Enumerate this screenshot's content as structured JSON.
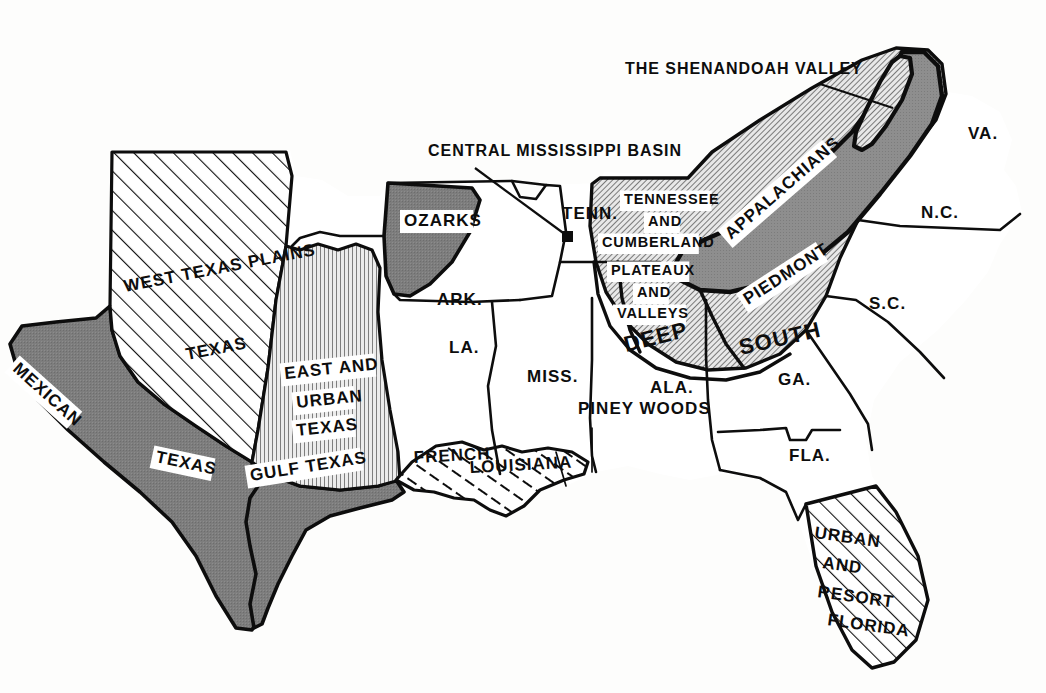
{
  "map": {
    "title": "Regions of the American South",
    "colors": {
      "ink": "#0d0d0d",
      "paper": "#fdfdfc",
      "dark_gray": "#7d7d7d",
      "mid_gray": "#9a9a9a",
      "light_gray": "#c9c9c9",
      "halo_white": "#ffffff"
    },
    "callouts": [
      {
        "id": "shenandoah",
        "text": "THE SHENANDOAH VALLEY",
        "x": 625,
        "y": 74,
        "leader_from": [
          820,
          84
        ],
        "leader_to": [
          893,
          108
        ]
      },
      {
        "id": "central-mississippi-basin",
        "text": "CENTRAL MISSISSIPPI BASIN",
        "x": 428,
        "y": 156,
        "leader_from": [
          475,
          168
        ],
        "leader_to": [
          568,
          237
        ]
      }
    ],
    "state_labels": [
      {
        "id": "tenn",
        "text": "TENN.",
        "x": 562,
        "y": 219
      },
      {
        "id": "ark",
        "text": "ARK.",
        "x": 437,
        "y": 305
      },
      {
        "id": "la",
        "text": "LA.",
        "x": 449,
        "y": 353
      },
      {
        "id": "miss",
        "text": "MISS.",
        "x": 527,
        "y": 382
      },
      {
        "id": "ala",
        "text": "ALA.",
        "x": 650,
        "y": 393
      },
      {
        "id": "ga",
        "text": "GA.",
        "x": 778,
        "y": 385
      },
      {
        "id": "fla",
        "text": "FLA.",
        "x": 789,
        "y": 461
      },
      {
        "id": "sc",
        "text": "S.C.",
        "x": 869,
        "y": 309
      },
      {
        "id": "nc",
        "text": "N.C.",
        "x": 921,
        "y": 218
      },
      {
        "id": "va",
        "text": "VA.",
        "x": 968,
        "y": 139
      }
    ],
    "region_labels": [
      {
        "id": "west-texas-plains",
        "text": "WEST TEXAS PLAINS",
        "x": 125,
        "y": 292,
        "rotate": -11,
        "halo": false,
        "size": "lbl-region"
      },
      {
        "id": "texas",
        "text": "TEXAS",
        "x": 187,
        "y": 360,
        "rotate": -11,
        "halo": false,
        "size": "lbl-region"
      },
      {
        "id": "mexican",
        "text": "MEXICAN",
        "x": 12,
        "y": 370,
        "rotate": 42,
        "halo": true,
        "size": "lbl-region"
      },
      {
        "id": "mexican-texas",
        "text": "TEXAS",
        "x": 155,
        "y": 462,
        "rotate": 12,
        "halo": true,
        "size": "lbl-region"
      },
      {
        "id": "gulf-texas",
        "text": "GULF TEXAS",
        "x": 251,
        "y": 481,
        "rotate": -9,
        "halo": true,
        "size": "lbl-region"
      },
      {
        "id": "east-and",
        "text": "EAST AND",
        "x": 285,
        "y": 379,
        "rotate": -6,
        "halo": true,
        "size": "lbl-region"
      },
      {
        "id": "urban",
        "text": "URBAN",
        "x": 297,
        "y": 408,
        "rotate": -6,
        "halo": true,
        "size": "lbl-region"
      },
      {
        "id": "east-urban-texas",
        "text": "TEXAS",
        "x": 297,
        "y": 436,
        "rotate": -6,
        "halo": true,
        "size": "lbl-region"
      },
      {
        "id": "ozarks",
        "text": "OZARKS",
        "x": 404,
        "y": 226,
        "rotate": 0,
        "halo": true,
        "size": "lbl-region"
      },
      {
        "id": "french",
        "text": "FRENCH",
        "x": 414,
        "y": 463,
        "rotate": -3,
        "halo": false,
        "size": "lbl-region"
      },
      {
        "id": "louisiana",
        "text": "LOUISIANA",
        "x": 470,
        "y": 473,
        "rotate": -3,
        "halo": false,
        "size": "lbl-region"
      },
      {
        "id": "piney-woods",
        "text": "PINEY WOODS",
        "x": 578,
        "y": 414,
        "rotate": 0,
        "halo": false,
        "size": "lbl-region"
      },
      {
        "id": "tennessee",
        "text": "TENNESSEE",
        "x": 624,
        "y": 204,
        "rotate": 0,
        "halo": true,
        "size": "lbl-small"
      },
      {
        "id": "and-1",
        "text": "AND",
        "x": 648,
        "y": 226,
        "rotate": 0,
        "halo": true,
        "size": "lbl-small"
      },
      {
        "id": "cumberland",
        "text": "CUMBERLAND",
        "x": 602,
        "y": 247,
        "rotate": 0,
        "halo": true,
        "size": "lbl-small"
      },
      {
        "id": "plateaux",
        "text": "PLATEAUX",
        "x": 611,
        "y": 275,
        "rotate": 0,
        "halo": true,
        "size": "lbl-small"
      },
      {
        "id": "and-2",
        "text": "AND",
        "x": 637,
        "y": 297,
        "rotate": 0,
        "halo": true,
        "size": "lbl-small"
      },
      {
        "id": "valleys",
        "text": "VALLEYS",
        "x": 617,
        "y": 318,
        "rotate": 0,
        "halo": true,
        "size": "lbl-small"
      },
      {
        "id": "appalachians",
        "text": "APPALACHIANS",
        "x": 731,
        "y": 240,
        "rotate": -41,
        "halo": true,
        "size": "lbl-region"
      },
      {
        "id": "piedmont",
        "text": "PIEDMONT",
        "x": 748,
        "y": 305,
        "rotate": -33,
        "halo": true,
        "size": "lbl-region"
      },
      {
        "id": "deep",
        "text": "DEEP",
        "x": 626,
        "y": 352,
        "rotate": -14,
        "halo": false,
        "size": "lbl-big"
      },
      {
        "id": "south",
        "text": "SOUTH",
        "x": 741,
        "y": 355,
        "rotate": -13,
        "halo": false,
        "size": "lbl-big"
      },
      {
        "id": "urban-fl",
        "text": "URBAN",
        "x": 814,
        "y": 538,
        "rotate": 8,
        "halo": false,
        "size": "lbl-region"
      },
      {
        "id": "and-3",
        "text": "AND",
        "x": 822,
        "y": 568,
        "rotate": 8,
        "halo": false,
        "size": "lbl-region"
      },
      {
        "id": "resort",
        "text": "RESORT",
        "x": 817,
        "y": 597,
        "rotate": 8,
        "halo": false,
        "size": "lbl-region"
      },
      {
        "id": "florida",
        "text": "FLORIDA",
        "x": 827,
        "y": 625,
        "rotate": 8,
        "halo": false,
        "size": "lbl-region"
      }
    ],
    "legend_textures": [
      {
        "id": "solid-dark",
        "name": "Mexican / Gulf Texas & Ozarks",
        "fill": "#7d7d7d"
      },
      {
        "id": "diag-hatch",
        "name": "Appalachians / Piedmont / Deep South uplands",
        "fill": "diagonal crosshatch"
      },
      {
        "id": "vert-hatch",
        "name": "East and Urban Texas",
        "fill": "vertical hatch"
      },
      {
        "id": "wide-diag",
        "name": "West Texas Plains / Urban & Resort Florida",
        "fill": "wide diagonal rule"
      }
    ]
  }
}
